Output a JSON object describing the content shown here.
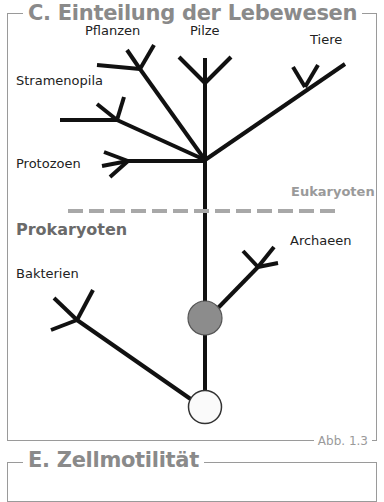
{
  "section_c": {
    "title": "C. Einteilung der Lebewesen",
    "figure_label": "Abb. 1.3"
  },
  "section_e": {
    "title": "E. Zellmotilität"
  },
  "labels": {
    "pflanzen": "Pflanzen",
    "pilze": "Pilze",
    "tiere": "Tiere",
    "stramenopila": "Stramenopila",
    "protozoen": "Protozoen",
    "eukaryoten": "Eukaryoten",
    "prokaryoten": "Prokaryoten",
    "archaeen": "Archaeen",
    "bakterien": "Bakterien"
  },
  "colors": {
    "line": "#111111",
    "divider": "#a8a8a8",
    "prokaryote_node": "#8c8c8c",
    "root_node": "#fafafa",
    "title_grey": "#8a8a8a"
  }
}
